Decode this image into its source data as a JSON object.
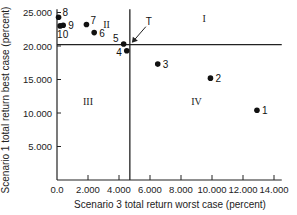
{
  "chart_data": {
    "type": "scatter",
    "title": "",
    "xlabel": "Scenario 3 total return worst case (percent)",
    "ylabel": "Scenario 1 total return best case (percent)",
    "xlim": [
      0,
      14.5
    ],
    "ylim": [
      0,
      25.5
    ],
    "x_ticks": [
      "0.0",
      "2.000",
      "4.000",
      "6.000",
      "8.000",
      "10.000",
      "12.000",
      "14.000"
    ],
    "x_tick_values": [
      0,
      2,
      4,
      6,
      8,
      10,
      12,
      14
    ],
    "y_ticks": [
      "5.000",
      "10.000",
      "15.000",
      "20.000",
      "25.000"
    ],
    "y_tick_values": [
      5,
      10,
      15,
      20,
      25
    ],
    "grid": false,
    "legend": null,
    "points": [
      {
        "label": "1",
        "x": 12.9,
        "y": 10.4
      },
      {
        "label": "2",
        "x": 9.9,
        "y": 15.2
      },
      {
        "label": "3",
        "x": 6.5,
        "y": 17.3
      },
      {
        "label": "4",
        "x": 4.5,
        "y": 19.3
      },
      {
        "label": "5",
        "x": 4.3,
        "y": 20.3
      },
      {
        "label": "6",
        "x": 2.4,
        "y": 22.0
      },
      {
        "label": "7",
        "x": 1.9,
        "y": 23.2
      },
      {
        "label": "8",
        "x": 0.1,
        "y": 24.3
      },
      {
        "label": "9",
        "x": 0.4,
        "y": 23.1
      },
      {
        "label": "10",
        "x": 0.2,
        "y": 23.0
      }
    ],
    "reference_lines": {
      "vertical_x": 4.7,
      "horizontal_y": 20.2
    },
    "quadrants": [
      {
        "label": "I",
        "x": 9.5,
        "y": 24.2
      },
      {
        "label": "II",
        "x": 3.2,
        "y": 23.3
      },
      {
        "label": "III",
        "x": 2.0,
        "y": 11.8
      },
      {
        "label": "IV",
        "x": 9.0,
        "y": 11.8
      }
    ],
    "annotations": [
      {
        "text": "T",
        "points_to": {
          "x": 4.7,
          "y": 20.2
        }
      }
    ]
  }
}
